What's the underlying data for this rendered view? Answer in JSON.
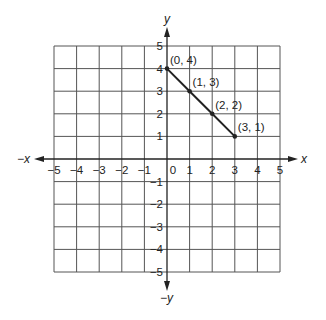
{
  "chart_data": {
    "type": "line",
    "title": "",
    "xlabel": "x",
    "ylabel": "y",
    "x_axis_labels": {
      "positive": "x",
      "negative": "−x"
    },
    "y_axis_labels": {
      "positive": "y",
      "negative": "−y"
    },
    "xlim": [
      -5,
      5
    ],
    "ylim": [
      -5,
      5
    ],
    "grid": true,
    "x_ticks": [
      "−5",
      "−4",
      "−3",
      "−2",
      "−1",
      "0",
      "1",
      "2",
      "3",
      "4",
      "5"
    ],
    "y_ticks": [
      "5",
      "4",
      "3",
      "2",
      "1",
      "−1",
      "−2",
      "−3",
      "−4",
      "−5"
    ],
    "series": [
      {
        "name": "line segment",
        "points": [
          {
            "x": 0,
            "y": 4,
            "label": "(0, 4)"
          },
          {
            "x": 1,
            "y": 3,
            "label": "(1, 3)"
          },
          {
            "x": 2,
            "y": 2,
            "label": "(2, 2)"
          },
          {
            "x": 3,
            "y": 1,
            "label": "(3, 1)"
          }
        ]
      }
    ],
    "colors": {
      "grid": "#555555",
      "line": "#222222",
      "text": "#222222"
    }
  }
}
